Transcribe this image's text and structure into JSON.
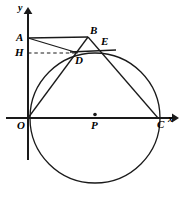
{
  "figure": {
    "background_color": "#ffffff",
    "stroke_color": "#1a1a1a",
    "width": 181,
    "height": 197
  },
  "axes": {
    "x_axis_label": "x",
    "y_axis_label": "y",
    "origin_label": "O",
    "x_axis_y": 118,
    "y_axis_x": 28,
    "x_axis_start": 6,
    "x_axis_end": 176,
    "y_axis_top": 10,
    "y_axis_bottom": 160
  },
  "circle": {
    "center_label": "P",
    "center_x": 95,
    "center_y": 118,
    "radius": 65,
    "center_dot_visible": true
  },
  "points": [
    {
      "label": "A",
      "x": 28,
      "y": 38,
      "label_x": 16,
      "label_y": 33,
      "on_axis": "y"
    },
    {
      "label": "B",
      "x": 88,
      "y": 37,
      "label_x": 90,
      "label_y": 26,
      "on_axis": ""
    },
    {
      "label": "E",
      "x": 99,
      "y": 45,
      "label_x": 101,
      "label_y": 37,
      "on_axis": ""
    },
    {
      "label": "H",
      "x": 28,
      "y": 53,
      "label_x": 16,
      "label_y": 48,
      "on_axis": "y"
    },
    {
      "label": "D",
      "x": 78,
      "y": 53,
      "label_x": 76,
      "label_y": 56,
      "on_axis": ""
    },
    {
      "label": "O",
      "x": 28,
      "y": 118,
      "label_x": 18,
      "label_y": 120,
      "on_axis": "origin"
    },
    {
      "label": "P",
      "x": 95,
      "y": 118,
      "label_x": 91,
      "label_y": 121,
      "on_axis": "x"
    },
    {
      "label": "C",
      "x": 158,
      "y": 118,
      "label_x": 158,
      "label_y": 120,
      "on_axis": "x"
    }
  ],
  "segments": [
    {
      "name": "A-to-B",
      "from": "A",
      "to": "B",
      "style": "solid"
    },
    {
      "name": "A-to-D",
      "from": "A",
      "to": "D",
      "style": "solid"
    },
    {
      "name": "O-to-B-through-D",
      "from": "O",
      "to": "B",
      "style": "solid"
    },
    {
      "name": "B-to-C-through-E",
      "from": "B",
      "to": "C",
      "style": "solid"
    },
    {
      "name": "D-to-E-extended",
      "from": "D",
      "to": "E",
      "style": "solid"
    },
    {
      "name": "H-to-D-dashed",
      "from": "H",
      "to": "D",
      "style": "dashed"
    }
  ]
}
